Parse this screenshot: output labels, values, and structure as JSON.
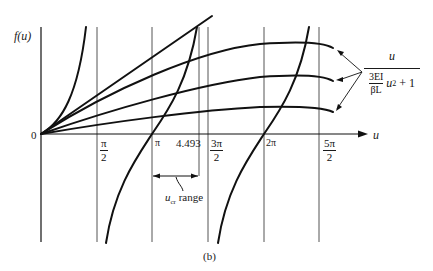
{
  "figure": {
    "caption": "(b)",
    "y_axis_label": "f(u)",
    "x_axis_label": "u",
    "origin_label": "0",
    "ticks": [
      {
        "id": "pi_over_2",
        "num": "π",
        "den": "2"
      },
      {
        "id": "pi",
        "label": "π"
      },
      {
        "id": "u4493",
        "label": "4.493"
      },
      {
        "id": "three_pi_over_2",
        "num": "3π",
        "den": "2"
      },
      {
        "id": "two_pi",
        "label": "2π"
      },
      {
        "id": "five_pi_over_2",
        "num": "5π",
        "den": "2"
      }
    ],
    "range_annotation": {
      "symbol": "u",
      "subscript": "cr",
      "text": "range"
    },
    "formula": {
      "numerator": "u",
      "coef_num": "3EI",
      "coef_den": "βL",
      "tail_var": "u",
      "tail_exp": "2",
      "tail_rest": "+ 1"
    },
    "curves": {
      "tan_branches": [
        "0 to π/2",
        "π/2 to 3π/2",
        "3π/2 to 5π/2"
      ],
      "rational_family_count": 3,
      "straight_line_count": 1
    }
  }
}
